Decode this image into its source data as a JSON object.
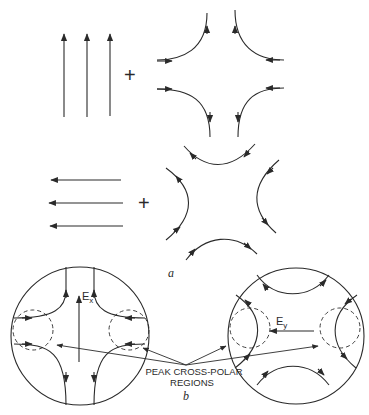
{
  "figure": {
    "part_a": {
      "label": "a",
      "row1": {
        "uniform_field": {
          "direction": "up",
          "arrow_count": 3
        },
        "operator": "+",
        "quadrupole": {
          "orientation": "axial"
        }
      },
      "row2": {
        "uniform_field": {
          "direction": "left",
          "arrow_count": 3
        },
        "operator": "+",
        "quadrupole": {
          "orientation": "diagonal"
        }
      }
    },
    "part_b": {
      "label": "b",
      "left_circle": {
        "field_label": "E",
        "field_subscript": "x"
      },
      "right_circle": {
        "field_label": "E",
        "field_subscript": "y"
      },
      "annotation_line1": "PEAK CROSS-POLAR",
      "annotation_line2": "REGIONS"
    },
    "colors": {
      "ink": "#2a2a2a",
      "background": "#ffffff"
    }
  }
}
